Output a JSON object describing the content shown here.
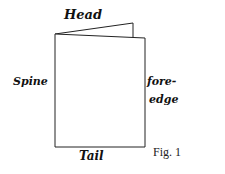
{
  "diagram": {
    "title": "Fig. 1",
    "labels": {
      "head": "Head",
      "spine": "Spine",
      "fore_edge_1": "fore-",
      "fore_edge_2": "edge",
      "tail": "Tail"
    },
    "colors": {
      "line": "#222222",
      "background": "#ffffff"
    }
  }
}
